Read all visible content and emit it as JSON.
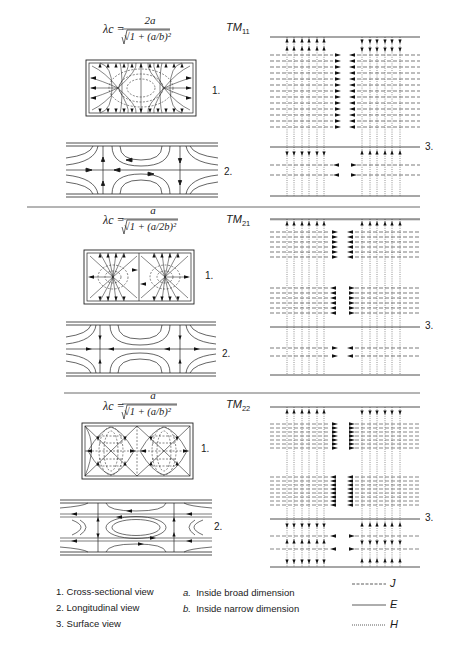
{
  "figure": {
    "sections": [
      {
        "mode_prefix": "TM",
        "mode_sub": "11",
        "formula_lhs": "λc =",
        "formula_numerator": "2a",
        "formula_denominator": "√1 + (a/b)²",
        "view_labels": [
          "1.",
          "2.",
          "3."
        ]
      },
      {
        "mode_prefix": "TM",
        "mode_sub": "21",
        "formula_lhs": "λc =",
        "formula_numerator": "a",
        "formula_denominator": "√1 + (a/2b)²",
        "view_labels": [
          "1.",
          "2.",
          "3."
        ]
      },
      {
        "mode_prefix": "TM",
        "mode_sub": "22",
        "formula_lhs": "λc =",
        "formula_numerator": "a",
        "formula_denominator": "√1 + (a/b)²",
        "view_labels": [
          "1.",
          "2.",
          "3."
        ]
      }
    ],
    "legend": {
      "views": [
        "1.  Cross-sectional view",
        "2.  Longitudinal view",
        "3.  Surface view"
      ],
      "dimensions": [
        {
          "key": "a.",
          "text": "Inside broad dimension"
        },
        {
          "key": "b.",
          "text": "Inside narrow  dimension"
        }
      ],
      "line_styles": [
        {
          "style": "dashed",
          "label": "J"
        },
        {
          "style": "solid",
          "label": "E"
        },
        {
          "style": "dotted",
          "label": "H"
        }
      ]
    }
  }
}
